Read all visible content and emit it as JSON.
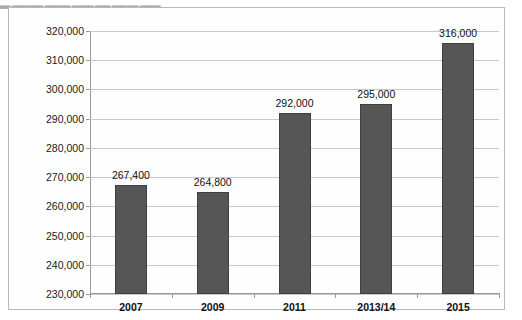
{
  "caption": {
    "text": "▃▃  ▃▃▃▃▃▃  ▃▃▃▃▃  ▃▃▃▃  ▃▃▃  ▃▃▃▃▃  ▃▃▃▃"
  },
  "chart_data": {
    "type": "bar",
    "title": "",
    "xlabel": "",
    "ylabel": "",
    "categories": [
      "2007",
      "2009",
      "2011",
      "2013/14",
      "2015"
    ],
    "values": [
      267400,
      264800,
      292000,
      295000,
      316000
    ],
    "value_labels": [
      "267,400",
      "264,800",
      "292,000",
      "295,000",
      "316,000"
    ],
    "ylim": [
      230000,
      320000
    ],
    "ytick_step": 10000,
    "ytick_labels": [
      "320,000",
      "310,000",
      "300,000",
      "290,000",
      "280,000",
      "270,000",
      "260,000",
      "250,000",
      "240,000",
      "230,000"
    ],
    "ytick_values": [
      320000,
      310000,
      300000,
      290000,
      280000,
      270000,
      260000,
      250000,
      240000,
      230000
    ],
    "grid": true,
    "legend": false,
    "legend_position": "none",
    "colors": {
      "bar_fill": "#565656",
      "bar_border": "#3f3f3f",
      "gridline": "#c8c8c8",
      "axis": "#9a9a9a",
      "frame": "#b9b9b9",
      "plot_background": "#fefefe",
      "text": "#111111"
    }
  }
}
